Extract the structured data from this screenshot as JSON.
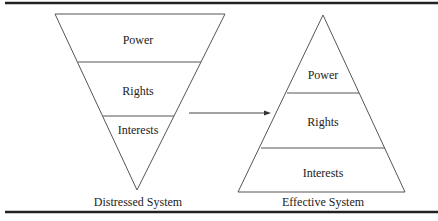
{
  "diagram": {
    "left": {
      "caption": "Distressed System",
      "shape": "inverted-triangle",
      "layers": [
        "Power",
        "Rights",
        "Interests"
      ]
    },
    "right": {
      "caption": "Effective System",
      "shape": "triangle",
      "layers": [
        "Power",
        "Rights",
        "Interests"
      ]
    },
    "arrow": {
      "from": "Distressed System",
      "to": "Effective System"
    },
    "colors": {
      "line": "#444444",
      "rule": "#222222",
      "text": "#222222"
    }
  }
}
